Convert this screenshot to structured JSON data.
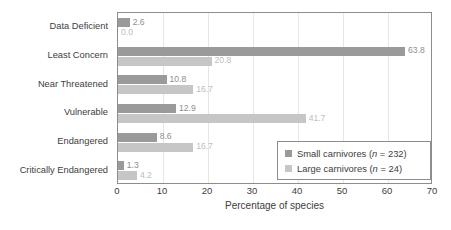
{
  "chart_data": {
    "type": "bar",
    "orientation": "horizontal",
    "title": "",
    "xlabel": "Percentage of species",
    "ylabel": "",
    "xlim": [
      0,
      70
    ],
    "xticks": [
      0,
      10,
      20,
      30,
      40,
      50,
      60,
      70
    ],
    "grid": true,
    "legend_position": "bottom-right",
    "categories": [
      "Data Deficient",
      "Least Concern",
      "Near Threatened",
      "Vulnerable",
      "Endangered",
      "Critically Endangered"
    ],
    "series": [
      {
        "name": "Small carnivores (n = 232)",
        "legend_label_text": "Small carnivores (",
        "legend_label_italic": "n",
        "legend_label_tail": " = 232)",
        "color": "#9a9a9a",
        "values": [
          2.6,
          63.8,
          10.8,
          12.9,
          8.6,
          1.3
        ],
        "value_labels": [
          "2.6",
          "63.8",
          "10.8",
          "12.9",
          "8.6",
          "1.3"
        ]
      },
      {
        "name": "Large carnivores (n = 24)",
        "legend_label_text": "Large carnivores (",
        "legend_label_italic": "n",
        "legend_label_tail": " = 24)",
        "color": "#c6c6c6",
        "values": [
          0.0,
          20.8,
          16.7,
          41.7,
          16.7,
          4.2
        ],
        "value_labels": [
          "0.0",
          "20.8",
          "16.7",
          "41.7",
          "16.7",
          "4.2"
        ]
      }
    ]
  }
}
